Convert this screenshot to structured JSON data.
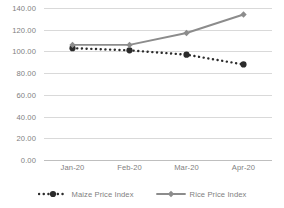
{
  "chart_data": {
    "type": "line",
    "title": "",
    "xlabel": "",
    "ylabel": "",
    "categories": [
      "Jan-20",
      "Feb-20",
      "Mar-20",
      "Apr-20"
    ],
    "ylim": [
      0,
      140
    ],
    "ytick_step": 20,
    "ytick_labels": [
      "140.00",
      "120.00",
      "100.00",
      "80.00",
      "60.00",
      "40.00",
      "20.00",
      "0.00"
    ],
    "ytick_values": [
      140,
      120,
      100,
      80,
      60,
      40,
      20,
      0
    ],
    "grid": true,
    "legend_position": "bottom",
    "series": [
      {
        "name": "Maize Price Index",
        "values": [
          103,
          101,
          97,
          88
        ],
        "color": "#2b2b2b",
        "line_style": "dotted",
        "marker": "circle"
      },
      {
        "name": "Rice Price Index",
        "values": [
          106,
          106,
          117,
          134
        ],
        "color": "#8c8c8c",
        "line_style": "solid",
        "marker": "diamond"
      }
    ]
  },
  "colors": {
    "gridline": "#d9d9d9",
    "axis": "#bfbfbf",
    "tick_text": "#808080",
    "maize": "#2b2b2b",
    "rice": "#8c8c8c",
    "background": "#ffffff"
  },
  "legend": {
    "items": [
      {
        "label": "Maize Price Index"
      },
      {
        "label": "Rice Price Index"
      }
    ]
  }
}
